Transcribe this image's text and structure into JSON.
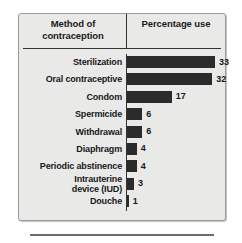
{
  "chart_data": {
    "type": "bar",
    "title": "",
    "orientation": "horizontal",
    "xlabel": "Percentage use",
    "ylabel": "Method of contraception",
    "categories": [
      "Sterilization",
      "Oral contraceptive",
      "Condom",
      "Spermicide",
      "Withdrawal",
      "Diaphragm",
      "Periodic abstinence",
      "Intrauterine\ndevice (IUD)",
      "Douche"
    ],
    "values": [
      33,
      32,
      17,
      6,
      6,
      4,
      4,
      3,
      1
    ],
    "value_labels": [
      "33",
      "32",
      "17",
      "6",
      "6",
      "4",
      "4",
      "3",
      "1"
    ],
    "xlim": [
      0,
      33
    ],
    "grid": false,
    "legend": null,
    "bar_color": "#2b2b2b",
    "background_color": "#e9e9e7"
  },
  "header": {
    "method_column": "Method of\ncontraception",
    "percentage_column": "Percentage\nuse"
  },
  "rows": [
    {
      "label": "Sterilization",
      "value": "33",
      "two_line": false
    },
    {
      "label": "Oral contraceptive",
      "value": "32",
      "two_line": false
    },
    {
      "label": "Condom",
      "value": "17",
      "two_line": false
    },
    {
      "label": "Spermicide",
      "value": "6",
      "two_line": false
    },
    {
      "label": "Withdrawal",
      "value": "6",
      "two_line": false
    },
    {
      "label": "Diaphragm",
      "value": "4",
      "two_line": false
    },
    {
      "label": "Periodic abstinence",
      "value": "4",
      "two_line": false
    },
    {
      "label": "Intrauterine\ndevice (IUD)",
      "value": "3",
      "two_line": true
    },
    {
      "label": "Douche",
      "value": "1",
      "two_line": false
    }
  ]
}
